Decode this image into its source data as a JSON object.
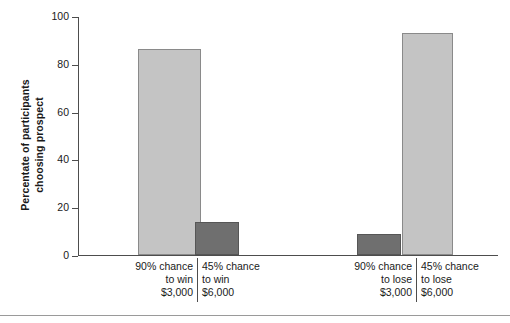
{
  "chart_data": {
    "type": "bar",
    "title": "",
    "xlabel": "",
    "ylabel": "Percentate of participants choosing prospect",
    "ylabel_lines": [
      "Percentate of participants",
      "choosing prospect"
    ],
    "ylim": [
      0,
      100
    ],
    "yticks": [
      {
        "value": 100,
        "label": "100"
      },
      {
        "value": 80,
        "label": "80"
      },
      {
        "value": 60,
        "label": "60"
      },
      {
        "value": 40,
        "label": "40"
      },
      {
        "value": 20,
        "label": "20"
      },
      {
        "value": 0,
        "label": "0"
      }
    ],
    "grid": false,
    "legend": "none",
    "categories": [
      "90% chance to win $3,000",
      "45% chance to win $6,000",
      "90% chance to lose $3,000",
      "45% chance to lose $6,000"
    ],
    "category_labels": [
      {
        "lines": [
          "90% chance",
          "to win",
          "$3,000"
        ],
        "align": "right",
        "divider": false
      },
      {
        "lines": [
          "45% chance",
          "to win",
          "$6,000"
        ],
        "align": "left",
        "divider": true
      },
      {
        "lines": [
          "90% chance",
          "to lose",
          "$3,000"
        ],
        "align": "right",
        "divider": false
      },
      {
        "lines": [
          "45% chance",
          "to lose",
          "$6,000"
        ],
        "align": "left",
        "divider": true
      }
    ],
    "values": [
      86,
      14,
      9,
      93
    ],
    "bar_styles": [
      "light",
      "dark",
      "dark",
      "light"
    ],
    "colors": {
      "light_bar": "#c4c4c4",
      "dark_bar": "#6f6f6f",
      "axis": "#4d4d4d",
      "text": "#1a1a1a",
      "background": "#ffffff"
    }
  }
}
